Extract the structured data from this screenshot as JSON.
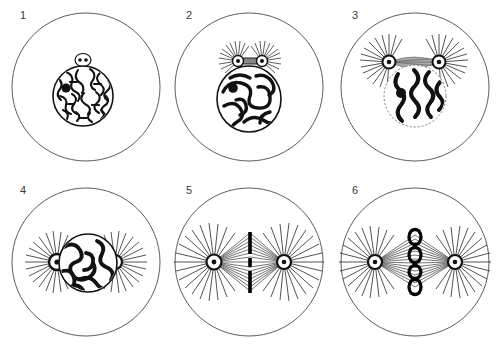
{
  "figure": {
    "style": "black-ink line engraving",
    "background_color": "#ffffff",
    "ink_color": "#111111",
    "outline_color": "#4a4a4a",
    "layout": {
      "rows": 2,
      "columns": 3,
      "panel_count": 6
    }
  },
  "panels": [
    {
      "number": "1",
      "label": "1",
      "stage": "resting-nucleus-interphase",
      "description": "Cell with round nucleus filled with fine chromatin reticulum, dark nucleolus at left, single small centrosome capsule above nucleus",
      "nucleus": {
        "shape": "circle",
        "chromatin": "fine reticulum network",
        "nucleolus": true
      },
      "centrosomes": 1,
      "aster_rays": 0,
      "spindle": false,
      "chromosome_count_visible": 0
    },
    {
      "number": "2",
      "label": "2",
      "stage": "early-prophase",
      "description": "Chromatin thickened into a coiled spireme, two centrosomes joined by a short bar above the nucleus, each with small radiating aster",
      "nucleus": {
        "shape": "circle",
        "chromatin": "thick coiled spireme",
        "nucleolus": true
      },
      "centrosomes": 2,
      "aster_rays": 26,
      "spindle": false,
      "chromosome_count_visible": 0
    },
    {
      "number": "3",
      "label": "3",
      "stage": "late-prophase",
      "description": "Centrosomes separated with central spindle bridge, large asters, bold wavy chromosomes inside nucleus",
      "nucleus": {
        "shape": "circle",
        "chromatin": "segmented bold wavy threads",
        "nucleolus": true
      },
      "centrosomes": 2,
      "aster_rays": 30,
      "spindle": true,
      "chromosome_count_visible": 4
    },
    {
      "number": "4",
      "label": "4",
      "stage": "prometaphase",
      "description": "Asters at opposite poles flanking the nucleus horizontally, thick convoluted chromosome skein filling nucleus",
      "nucleus": {
        "shape": "circle",
        "chromatin": "thick convoluted skein",
        "nucleolus": false
      },
      "centrosomes": 2,
      "aster_rays": 34,
      "spindle": false,
      "chromosome_count_visible": 0
    },
    {
      "number": "5",
      "label": "5",
      "stage": "metaphase-spindle",
      "description": "Full achromatic spindle between two asters, chromosomes fused into a dark vertical equatorial plate of bar segments",
      "nucleus": {
        "shape": "none",
        "chromatin": "equatorial plate",
        "nucleolus": false
      },
      "centrosomes": 2,
      "aster_rays": 36,
      "spindle": true,
      "spindle_fibers": 30,
      "equatorial_plate_segments": 3,
      "chromosome_count_visible": 0
    },
    {
      "number": "6",
      "label": "6",
      "stage": "metaphase-chromosomes-resolved",
      "description": "Spindle with four distinct loop- and V-shaped chromosomes stacked vertically at the equatorial plate",
      "nucleus": {
        "shape": "none",
        "chromatin": "discrete chromosomes",
        "nucleolus": false
      },
      "centrosomes": 2,
      "aster_rays": 36,
      "spindle": true,
      "spindle_fibers": 30,
      "chromosome_count_visible": 4
    }
  ]
}
